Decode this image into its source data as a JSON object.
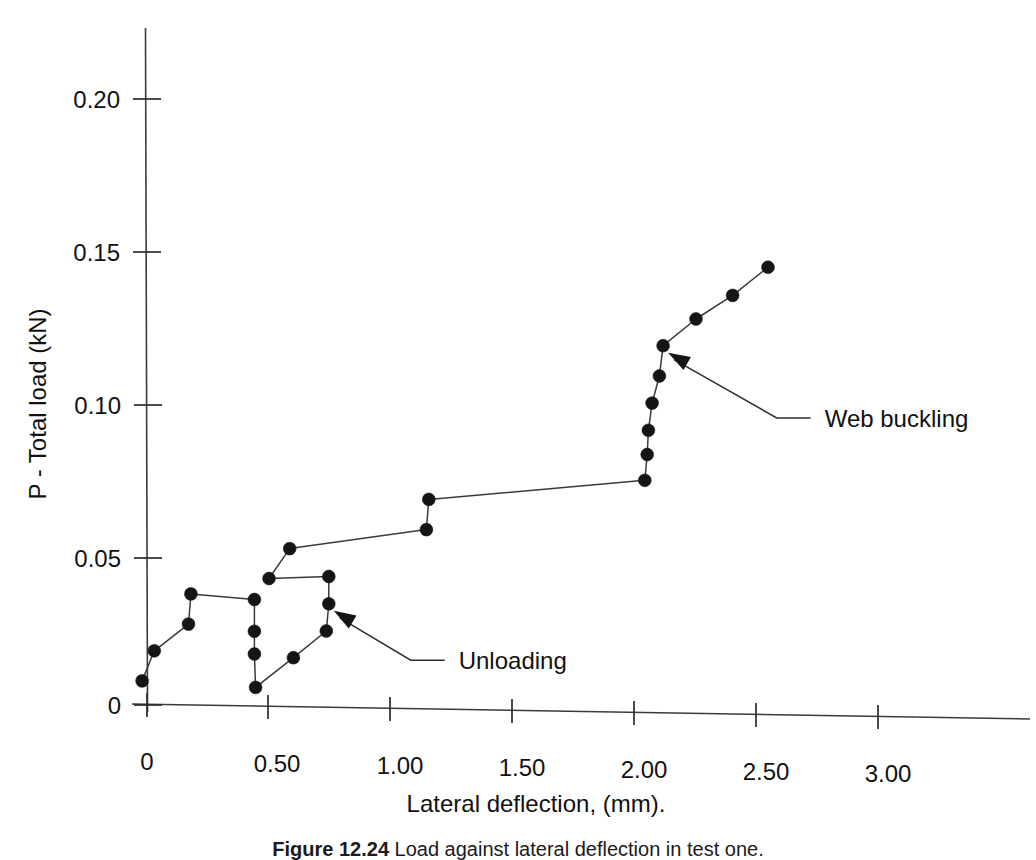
{
  "chart_data": {
    "type": "line",
    "title": "",
    "xlabel": "Lateral deflection, (mm).",
    "ylabel": "P - Total load (kN)",
    "xlim": [
      -0.06,
      3.22
    ],
    "ylim": [
      0,
      0.23
    ],
    "xticks": [
      0,
      0.5,
      1.0,
      1.5,
      2.0,
      2.5,
      3.0
    ],
    "xticklabels": [
      "0",
      "0.50",
      "1.00",
      "1.50",
      "2.00",
      "2.50",
      "3.00"
    ],
    "yticks": [
      0,
      0.05,
      0.1,
      0.15,
      0.2
    ],
    "yticklabels": [
      "0",
      "0.05",
      "0.10",
      "0.15",
      "0.20"
    ],
    "grid": false,
    "legend": null,
    "marker": "filled-circle",
    "series": [
      {
        "name": "Load vs lateral deflection",
        "points": [
          [
            -0.02,
            0.008
          ],
          [
            0.03,
            0.018
          ],
          [
            0.17,
            0.027
          ],
          [
            0.18,
            0.037
          ],
          [
            0.44,
            0.0355
          ],
          [
            0.44,
            0.025
          ],
          [
            0.44,
            0.0175
          ],
          [
            0.445,
            0.0065
          ],
          [
            0.6,
            0.0165
          ],
          [
            0.735,
            0.0255
          ],
          [
            0.745,
            0.0345
          ],
          [
            0.745,
            0.0435
          ],
          [
            0.5,
            0.0425
          ],
          [
            0.585,
            0.0525
          ],
          [
            1.145,
            0.0595
          ],
          [
            1.155,
            0.0695
          ],
          [
            2.04,
            0.077
          ],
          [
            2.05,
            0.0855
          ],
          [
            2.055,
            0.0935
          ],
          [
            2.07,
            0.1025
          ],
          [
            2.1,
            0.1115
          ],
          [
            2.115,
            0.1215
          ],
          [
            2.25,
            0.1305
          ],
          [
            2.4,
            0.1385
          ],
          [
            2.545,
            0.148
          ]
        ]
      }
    ],
    "annotations": [
      {
        "text": "Web buckling",
        "target_point": [
          2.115,
          0.1215
        ],
        "label_x": 2.72,
        "label_y": 0.0985
      },
      {
        "text": "Unloading",
        "target_point": [
          0.745,
          0.0345
        ],
        "label_x": 1.22,
        "label_y": 0.0165
      }
    ]
  },
  "figure": {
    "caption_prefix": "Figure 12.24",
    "caption_rest": "Load against lateral deflection in test one."
  }
}
